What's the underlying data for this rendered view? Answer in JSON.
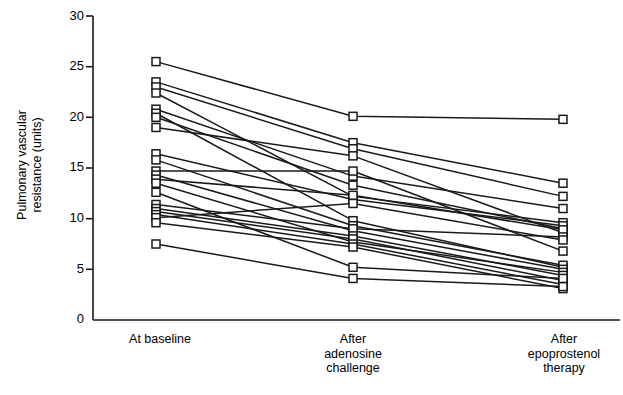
{
  "chart_data": {
    "type": "line",
    "subtype": "parallel-coordinates-slopegraph",
    "title": "",
    "xlabel": "",
    "ylabel": "Pulmonary vascular resistance (units)",
    "ylabel_lines": [
      "Pulmonary vascular",
      "resistance (units)"
    ],
    "categories": [
      "At baseline",
      "After adenosine challenge",
      "After epoprostenol therapy"
    ],
    "category_lines": [
      [
        "At baseline"
      ],
      [
        "After",
        "adenosine",
        "challenge"
      ],
      [
        "After",
        "epoprostenol",
        "therapy"
      ]
    ],
    "ylim": [
      0,
      30
    ],
    "yticks": [
      0,
      5,
      10,
      15,
      20,
      25,
      30
    ],
    "ytick_labels": [
      "0",
      "5",
      "10",
      "15",
      "20",
      "25",
      "30"
    ],
    "grid": false,
    "legend": false,
    "marker": "open-square",
    "line_color": "#1a1a1a",
    "marker_fill": "#ffffff",
    "marker_stroke": "#1a1a1a",
    "axis_color": "#1a1a1a",
    "n_subjects": 22,
    "series": [
      {
        "name": "subject-1",
        "values": [
          25.5,
          20.1,
          19.8
        ]
      },
      {
        "name": "subject-2",
        "values": [
          23.5,
          17.5,
          13.5
        ]
      },
      {
        "name": "subject-3",
        "values": [
          23.0,
          16.9,
          12.2
        ]
      },
      {
        "name": "subject-4",
        "values": [
          22.4,
          12.2,
          9.6
        ]
      },
      {
        "name": "subject-5",
        "values": [
          20.8,
          14.2,
          11.0
        ]
      },
      {
        "name": "subject-6",
        "values": [
          20.4,
          9.8,
          5.2
        ]
      },
      {
        "name": "subject-7",
        "values": [
          20.0,
          13.3,
          9.0
        ]
      },
      {
        "name": "subject-8",
        "values": [
          19.0,
          16.2,
          8.6
        ]
      },
      {
        "name": "subject-9",
        "values": [
          16.4,
          11.9,
          9.3
        ]
      },
      {
        "name": "subject-10",
        "values": [
          15.8,
          9.3,
          5.4
        ]
      },
      {
        "name": "subject-11",
        "values": [
          14.7,
          14.7,
          6.8
        ]
      },
      {
        "name": "subject-12",
        "values": [
          14.3,
          8.8,
          5.0
        ]
      },
      {
        "name": "subject-13",
        "values": [
          13.9,
          12.3,
          8.9
        ]
      },
      {
        "name": "subject-14",
        "values": [
          13.5,
          7.7,
          4.7
        ]
      },
      {
        "name": "subject-15",
        "values": [
          11.4,
          9.0,
          8.2
        ]
      },
      {
        "name": "subject-16",
        "values": [
          11.0,
          8.3,
          4.4
        ]
      },
      {
        "name": "subject-17",
        "values": [
          10.7,
          8.0,
          3.9
        ]
      },
      {
        "name": "subject-18",
        "values": [
          10.4,
          7.5,
          3.5
        ]
      },
      {
        "name": "subject-19",
        "values": [
          10.1,
          11.5,
          7.9
        ]
      },
      {
        "name": "subject-20",
        "values": [
          9.6,
          7.2,
          3.1
        ]
      },
      {
        "name": "subject-21",
        "values": [
          7.5,
          4.1,
          3.3
        ]
      },
      {
        "name": "subject-22",
        "values": [
          12.6,
          5.2,
          4.1
        ]
      }
    ]
  },
  "axes": {
    "y_tick_text": [
      "30",
      "25",
      "20",
      "15",
      "10",
      "5",
      "0"
    ]
  }
}
